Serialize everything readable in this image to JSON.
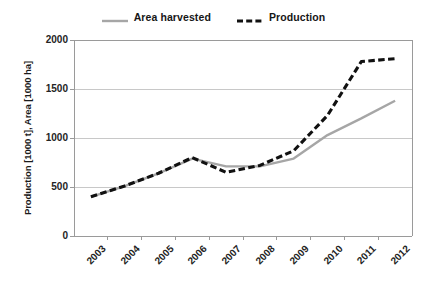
{
  "chart_data": {
    "type": "line",
    "title": "",
    "xlabel": "",
    "ylabel": "Production [1000 t], Area [1000 ha]",
    "categories": [
      "2003",
      "2004",
      "2005",
      "2006",
      "2007",
      "2008",
      "2009",
      "2010",
      "2011",
      "2012"
    ],
    "ylim": [
      0,
      2000
    ],
    "yticks": [
      "0",
      "500",
      "1000",
      "1500",
      "2000"
    ],
    "ytick_values": [
      0,
      500,
      1000,
      1500,
      2000
    ],
    "grid": "horizontal",
    "legend_position": "top-center",
    "series": [
      {
        "name": "Area harvested",
        "color": "#a6a6a6",
        "style": "solid",
        "values": [
          400,
          510,
          640,
          790,
          710,
          710,
          790,
          1030,
          1200,
          1380
        ]
      },
      {
        "name": "Production",
        "color": "#111111",
        "style": "dashed",
        "values": [
          400,
          510,
          640,
          800,
          650,
          720,
          870,
          1230,
          1780,
          1810
        ]
      }
    ]
  },
  "legend": {
    "items": [
      {
        "label": "Area harvested",
        "color": "#a6a6a6",
        "style": "solid"
      },
      {
        "label": "Production",
        "color": "#111111",
        "style": "dashed"
      }
    ]
  },
  "axes": {
    "y_title": "Production [1000 t], Area [1000 ha]",
    "y_ticks": [
      "2000",
      "1500",
      "1000",
      "500",
      "0"
    ],
    "x_ticks": [
      "2003",
      "2004",
      "2005",
      "2006",
      "2007",
      "2008",
      "2009",
      "2010",
      "2011",
      "2012"
    ]
  },
  "colors": {
    "area_harvested": "#a6a6a6",
    "production": "#111111",
    "gridline": "#c8c8c8",
    "axis": "#9a9a9a",
    "background": "#ffffff",
    "text": "#242424"
  }
}
